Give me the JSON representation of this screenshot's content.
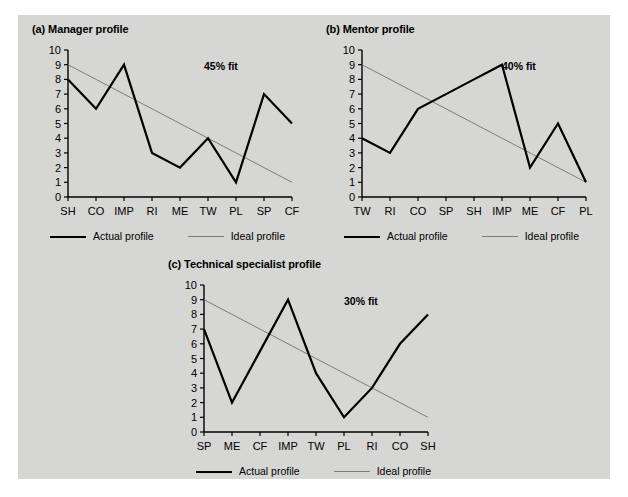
{
  "figure": {
    "background_color": "#d6d6d4",
    "page_color": "#ffffff",
    "actual_color": "#000000",
    "ideal_color": "#7d7d7d"
  },
  "legend": {
    "actual_label": "Actual profile",
    "ideal_label": "Ideal profile"
  },
  "charts": {
    "a": {
      "title": "(a) Manager profile",
      "fit_label": "45% fit"
    },
    "b": {
      "title": "(b) Mentor profile",
      "fit_label": "40% fit"
    },
    "c": {
      "title": "(c) Technical specialist profile",
      "fit_label": "30% fit"
    }
  },
  "chart_data": [
    {
      "type": "line",
      "title": "(a) Manager profile",
      "xlabel": "",
      "ylabel": "",
      "ylim": [
        0,
        10
      ],
      "yticks": [
        0,
        1,
        2,
        3,
        4,
        5,
        6,
        7,
        8,
        9,
        10
      ],
      "grid": false,
      "legend_position": "below",
      "annotations": [
        "45% fit"
      ],
      "categories": [
        "SH",
        "CO",
        "IMP",
        "RI",
        "ME",
        "TW",
        "PL",
        "SP",
        "CF"
      ],
      "series": [
        {
          "name": "Actual profile",
          "values": [
            8,
            6,
            9,
            3,
            2,
            4,
            1,
            7,
            5
          ],
          "color": "#000000",
          "width": 2.2
        },
        {
          "name": "Ideal profile",
          "values": [
            9,
            8,
            7,
            6,
            5,
            4,
            3,
            2,
            1
          ],
          "color": "#7d7d7d",
          "width": 1
        }
      ]
    },
    {
      "type": "line",
      "title": "(b) Mentor profile",
      "xlabel": "",
      "ylabel": "",
      "ylim": [
        0,
        10
      ],
      "yticks": [
        0,
        1,
        2,
        3,
        4,
        5,
        6,
        7,
        8,
        9,
        10
      ],
      "grid": false,
      "legend_position": "below",
      "annotations": [
        "40% fit"
      ],
      "categories": [
        "TW",
        "RI",
        "CO",
        "SP",
        "SH",
        "IMP",
        "ME",
        "CF",
        "PL"
      ],
      "series": [
        {
          "name": "Actual profile",
          "values": [
            4,
            3,
            6,
            7,
            8,
            9,
            2,
            5,
            1
          ],
          "color": "#000000",
          "width": 2.2
        },
        {
          "name": "Ideal profile",
          "values": [
            9,
            8,
            7,
            6,
            5,
            4,
            3,
            2,
            1
          ],
          "color": "#7d7d7d",
          "width": 1
        }
      ]
    },
    {
      "type": "line",
      "title": "(c) Technical specialist profile",
      "xlabel": "",
      "ylabel": "",
      "ylim": [
        0,
        10
      ],
      "yticks": [
        0,
        1,
        2,
        3,
        4,
        5,
        6,
        7,
        8,
        9,
        10
      ],
      "grid": false,
      "legend_position": "below",
      "annotations": [
        "30% fit"
      ],
      "categories": [
        "SP",
        "ME",
        "CF",
        "IMP",
        "TW",
        "PL",
        "RI",
        "CO",
        "SH"
      ],
      "series": [
        {
          "name": "Actual profile",
          "values": [
            7,
            2,
            5.5,
            9,
            4,
            1,
            3,
            6,
            8
          ],
          "color": "#000000",
          "width": 2.2
        },
        {
          "name": "Ideal profile",
          "values": [
            9,
            8,
            7,
            6,
            5,
            4,
            3,
            2,
            1
          ],
          "color": "#7d7d7d",
          "width": 1
        }
      ]
    }
  ]
}
